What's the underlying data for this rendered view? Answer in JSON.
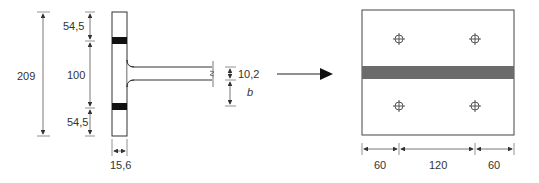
{
  "diagram": {
    "type": "technical-drawing",
    "colors": {
      "line": "#333333",
      "dim_line": "#555555",
      "flange_band": "#111111",
      "plate_band": "#6b6b6b"
    },
    "left_view": {
      "name": "t-stub-section",
      "dimensions": {
        "overall_height": "209",
        "top_edge": "54,5",
        "bolt_spacing": "100",
        "bottom_edge": "54,5",
        "flange_thickness": "15,6",
        "web_thickness": "10,2",
        "web_extension": "b"
      }
    },
    "arrow": {
      "direction": "right"
    },
    "right_view": {
      "name": "plate-plan-view",
      "bolt_holes": 4,
      "dimensions": {
        "left_edge": "60",
        "bolt_pitch": "120",
        "right_edge": "60"
      }
    }
  }
}
